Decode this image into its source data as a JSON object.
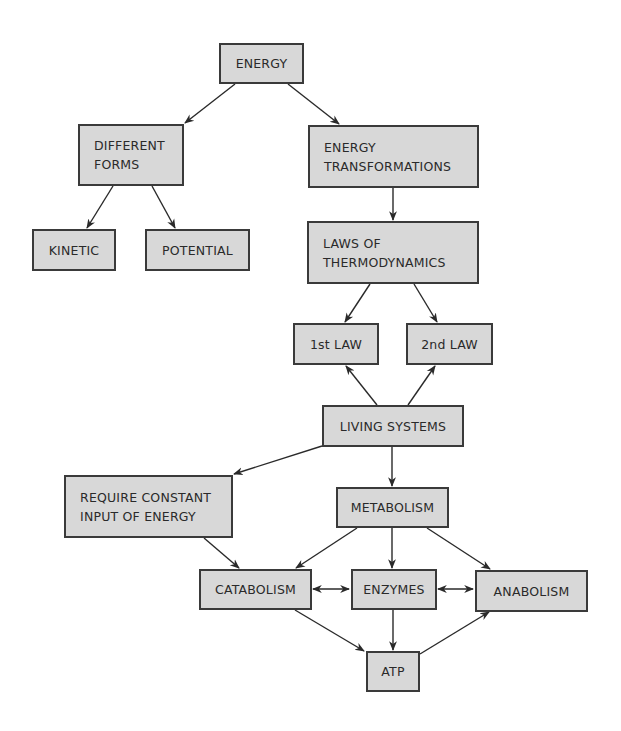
{
  "diagram": {
    "colors": {
      "box_fill": "#d8d8d8",
      "box_border": "#3a3a3a",
      "arrow": "#2a2a2a",
      "text": "#2a2a2a"
    },
    "nodes": {
      "energy": {
        "label": "ENERGY"
      },
      "forms": {
        "label": "DIFFERENT\nFORMS"
      },
      "transform": {
        "label": "ENERGY\nTRANSFORMATIONS"
      },
      "kinetic": {
        "label": "KINETIC"
      },
      "potential": {
        "label": "POTENTIAL"
      },
      "laws": {
        "label": "LAWS OF\nTHERMODYNAMICS"
      },
      "first_law": {
        "label": "1st LAW"
      },
      "second_law": {
        "label": "2nd LAW"
      },
      "living": {
        "label": "LIVING SYSTEMS"
      },
      "require": {
        "label": "REQUIRE CONSTANT\nINPUT OF ENERGY"
      },
      "metabolism": {
        "label": "METABOLISM"
      },
      "catabolism": {
        "label": "CATABOLISM"
      },
      "enzymes": {
        "label": "ENZYMES"
      },
      "anabolism": {
        "label": "ANABOLISM"
      },
      "atp": {
        "label": "ATP"
      }
    },
    "edges": [
      {
        "from": "ENERGY",
        "to": "DIFFERENT FORMS",
        "type": "arrow"
      },
      {
        "from": "ENERGY",
        "to": "ENERGY TRANSFORMATIONS",
        "type": "arrow"
      },
      {
        "from": "DIFFERENT FORMS",
        "to": "KINETIC",
        "type": "arrow"
      },
      {
        "from": "DIFFERENT FORMS",
        "to": "POTENTIAL",
        "type": "arrow"
      },
      {
        "from": "ENERGY TRANSFORMATIONS",
        "to": "LAWS OF THERMODYNAMICS",
        "type": "arrow"
      },
      {
        "from": "LAWS OF THERMODYNAMICS",
        "to": "1st LAW",
        "type": "arrow"
      },
      {
        "from": "LAWS OF THERMODYNAMICS",
        "to": "2nd LAW",
        "type": "arrow"
      },
      {
        "from": "LIVING SYSTEMS",
        "to": "1st LAW",
        "type": "arrow"
      },
      {
        "from": "LIVING SYSTEMS",
        "to": "2nd LAW",
        "type": "arrow"
      },
      {
        "from": "LIVING SYSTEMS",
        "to": "REQUIRE CONSTANT INPUT OF ENERGY",
        "type": "arrow"
      },
      {
        "from": "LIVING SYSTEMS",
        "to": "METABOLISM",
        "type": "arrow"
      },
      {
        "from": "REQUIRE CONSTANT INPUT OF ENERGY",
        "to": "CATABOLISM",
        "type": "arrow"
      },
      {
        "from": "METABOLISM",
        "to": "CATABOLISM",
        "type": "arrow"
      },
      {
        "from": "METABOLISM",
        "to": "ENZYMES",
        "type": "arrow"
      },
      {
        "from": "METABOLISM",
        "to": "ANABOLISM",
        "type": "arrow"
      },
      {
        "from": "CATABOLISM",
        "to": "ENZYMES",
        "type": "double-arrow"
      },
      {
        "from": "ENZYMES",
        "to": "ANABOLISM",
        "type": "double-arrow"
      },
      {
        "from": "CATABOLISM",
        "to": "ATP",
        "type": "arrow"
      },
      {
        "from": "ENZYMES",
        "to": "ATP",
        "type": "arrow"
      },
      {
        "from": "ATP",
        "to": "ANABOLISM",
        "type": "arrow"
      }
    ]
  }
}
